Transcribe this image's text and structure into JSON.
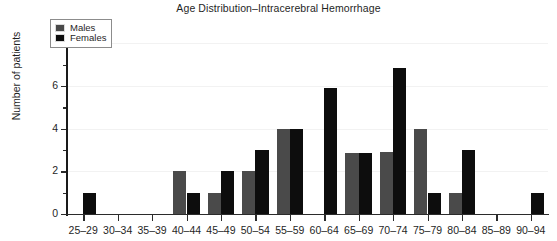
{
  "chart_data": {
    "type": "bar",
    "title": "Age Distribution–Intracerebral Hemorrhage",
    "xlabel": "",
    "ylabel": "Number of patients",
    "ylim": [
      0,
      8.3
    ],
    "yticks": [
      0,
      2,
      4,
      6,
      8
    ],
    "ytick_labels": [
      "0",
      "2",
      "4",
      "6",
      "8"
    ],
    "yminor_ticks": [
      1,
      3,
      5,
      7
    ],
    "grid": true,
    "grid_axis": "y",
    "legend_position": "top-left",
    "categories": [
      "25–29",
      "30–34",
      "35–39",
      "40–44",
      "45–49",
      "50–54",
      "55–59",
      "60–64",
      "65–69",
      "70–74",
      "75–79",
      "80–84",
      "85–89",
      "90–94"
    ],
    "series": [
      {
        "name": "Males",
        "color": "#4a4a4a",
        "values": [
          0,
          0,
          0,
          2,
          1,
          2,
          4,
          0,
          2.85,
          2.9,
          4,
          1,
          0,
          0
        ]
      },
      {
        "name": "Females",
        "color": "#0d0d0d",
        "values": [
          1,
          0,
          0,
          1,
          2,
          3,
          4,
          5.9,
          2.85,
          6.85,
          1,
          3,
          0,
          1
        ]
      }
    ]
  },
  "legend": {
    "items": [
      {
        "label": "Males",
        "swatch": "male"
      },
      {
        "label": "Females",
        "swatch": "female"
      }
    ]
  }
}
